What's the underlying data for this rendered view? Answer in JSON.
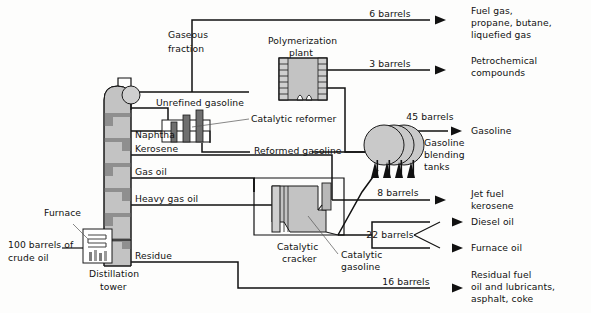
{
  "diagram": {
    "equipment": [
      {
        "id": "distillation-tower",
        "label": "Distillation\ntower",
        "label_line1": "Distillation",
        "label_line2": "tower"
      },
      {
        "id": "furnace",
        "label": "Furnace"
      },
      {
        "id": "polymerization-plant",
        "label_line1": "Polymerization",
        "label_line2": "plant"
      },
      {
        "id": "catalytic-reformer",
        "label": "Catalytic reformer"
      },
      {
        "id": "catalytic-cracker",
        "label_line1": "Catalytic",
        "label_line2": "cracker"
      },
      {
        "id": "gasoline-blending-tanks",
        "label_line1": "Gasoline",
        "label_line2": "blending",
        "label_line3": "tanks"
      }
    ],
    "input": {
      "label_line1": "100 barrels of",
      "label_line2": "crude oil",
      "quantity": "100 barrels",
      "material": "crude oil"
    },
    "fractions": [
      {
        "id": "gaseous-fraction",
        "label_line1": "Gaseous",
        "label_line2": "fraction"
      },
      {
        "id": "unrefined-gasoline",
        "label": "Unrefined gasoline"
      },
      {
        "id": "naphtha",
        "label": "Naphtha"
      },
      {
        "id": "kerosene",
        "label": "Kerosene"
      },
      {
        "id": "gas-oil",
        "label": "Gas oil"
      },
      {
        "id": "heavy-gas-oil",
        "label": "Heavy gas oil"
      },
      {
        "id": "residue",
        "label": "Residue"
      }
    ],
    "intermediates": [
      {
        "id": "reformed-gasoline",
        "label": "Reformed gasoline"
      },
      {
        "id": "catalytic-gasoline",
        "label_line1": "Catalytic",
        "label_line2": "gasoline"
      }
    ],
    "outputs": [
      {
        "id": "fuel-gas",
        "quantity": "6 barrels",
        "product_line1": "Fuel gas,",
        "product_line2": "propane, butane,",
        "product_line3": "liquefied gas"
      },
      {
        "id": "petrochemical-compounds",
        "quantity": "3 barrels",
        "product_line1": "Petrochemical",
        "product_line2": "compounds"
      },
      {
        "id": "gasoline",
        "quantity": "45 barrels",
        "product_line1": "Gasoline"
      },
      {
        "id": "jet-fuel-kerosene",
        "quantity": "8 barrels",
        "product_line1": "Jet fuel",
        "product_line2": "kerosene"
      },
      {
        "id": "diesel-furnace-oil",
        "quantity": "22 barrels",
        "product_line1": "Diesel oil",
        "product_line2": "Furnace oil"
      },
      {
        "id": "residual-fuel",
        "quantity": "16 barrels",
        "product_line1": "Residual fuel",
        "product_line2": "oil and lubricants,",
        "product_line3": "asphalt, coke"
      }
    ],
    "colors": {
      "line": "#111111",
      "equipment_fill": "#c3c3c3",
      "equipment_fill_light": "#cfcfcf",
      "tray": "#8f8f8f",
      "background": "#fdfdfc"
    }
  }
}
